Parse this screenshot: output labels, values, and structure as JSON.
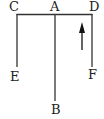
{
  "diagram": {
    "labels": {
      "C": "C",
      "A": "A",
      "D": "D",
      "E": "E",
      "B": "B",
      "F": "F"
    },
    "line_color": "#333333",
    "arrow": {
      "direction": "up",
      "color": "#111111"
    }
  }
}
